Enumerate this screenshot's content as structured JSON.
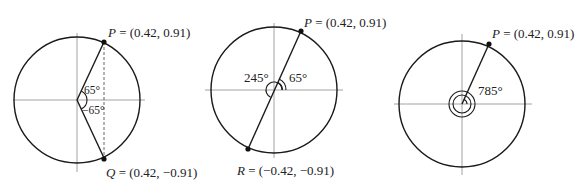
{
  "figures": [
    {
      "id": "fig1",
      "point_P": {
        "name": "P",
        "coords": "(0.42, 0.91)",
        "label": " = (0.42, 0.91)"
      },
      "point_Q": {
        "name": "Q",
        "coords": "(0.42, −0.91)",
        "label": " = (0.42, −0.91)"
      },
      "angle_upper": "65°",
      "angle_lower": "−65°"
    },
    {
      "id": "fig2",
      "point_P": {
        "name": "P",
        "coords": "(0.42, 0.91)",
        "label": " = (0.42, 0.91)"
      },
      "point_R": {
        "name": "R",
        "coords": "(−0.42, −0.91)",
        "label": " = (−0.42, −0.91)"
      },
      "angle_small": "65°",
      "angle_large": "245°"
    },
    {
      "id": "fig3",
      "point_P": {
        "name": "P",
        "coords": "(0.42, 0.91)",
        "label": " = (0.42, 0.91)"
      },
      "angle": "785°"
    }
  ],
  "colors": {
    "stroke": "#1a1a1a",
    "axis": "#8a8a8a",
    "background": "#ffffff"
  }
}
